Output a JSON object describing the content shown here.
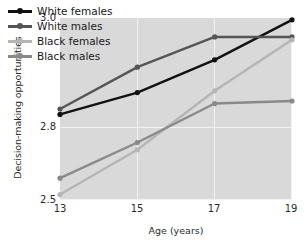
{
  "chart_data": {
    "type": "line",
    "title": "",
    "xlabel": "Age (years)",
    "ylabel": "Decision-making opportunities",
    "x": [
      13,
      15,
      17,
      19
    ],
    "xticklabels": [
      "13",
      "15",
      "17",
      "19"
    ],
    "yticks": [
      2.5,
      2.8,
      3.0
    ],
    "yticklabels": [
      "2.5",
      "2.8",
      "3.0"
    ],
    "ylim": [
      2.5,
      3.0
    ],
    "xlim": [
      13,
      19
    ],
    "grid": true,
    "legend_position": "top-left",
    "panel_background": "#d9d9d9",
    "gridline_color": "#f2f2f2",
    "series": [
      {
        "name": "White females",
        "color": "#111111",
        "marker": "circle",
        "values": [
          2.735,
          2.795,
          2.885,
          2.995
        ]
      },
      {
        "name": "White males",
        "color": "#555555",
        "marker": "circle",
        "values": [
          2.75,
          2.865,
          2.948,
          2.948
        ]
      },
      {
        "name": "Black females",
        "color": "#b5b5b5",
        "marker": "circle",
        "values": [
          2.515,
          2.638,
          2.8,
          2.94
        ]
      },
      {
        "name": "Black males",
        "color": "#8a8a8a",
        "marker": "circle",
        "values": [
          2.56,
          2.658,
          2.765,
          2.772
        ]
      }
    ]
  },
  "axis": {
    "y_title": "Decision-making opportunities",
    "x_title": "Age (years)",
    "y_tick_top": "3.0",
    "y_tick_mid": "2.8",
    "y_tick_bottom": "2.5",
    "x_tick_1": "13",
    "x_tick_2": "15",
    "x_tick_3": "17",
    "x_tick_4": "19"
  },
  "legend": {
    "items": [
      {
        "label": "White females",
        "color": "#111111"
      },
      {
        "label": "White males",
        "color": "#555555"
      },
      {
        "label": "Black females",
        "color": "#b5b5b5"
      },
      {
        "label": "Black males",
        "color": "#8a8a8a"
      }
    ]
  }
}
